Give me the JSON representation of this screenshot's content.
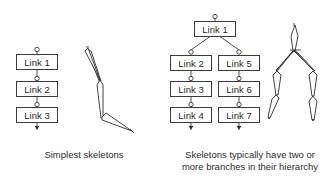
{
  "left_diagram": {
    "caption": "Simplest skeletons",
    "links": [
      {
        "label": "Link 1"
      },
      {
        "label": "Link 2"
      },
      {
        "label": "Link 3"
      }
    ]
  },
  "right_diagram": {
    "caption_line1": "Skeletons typically have two or",
    "caption_line2": "more branches in their hierarchy",
    "root": {
      "label": "Link 1"
    },
    "branch_left": [
      {
        "label": "Link 2"
      },
      {
        "label": "Link 3"
      },
      {
        "label": "Link 4"
      }
    ],
    "branch_right": [
      {
        "label": "Link 5"
      },
      {
        "label": "Link 6"
      },
      {
        "label": "Link 7"
      }
    ]
  },
  "colors": {
    "stroke": "#3a3a3a",
    "background": "#ffffff",
    "text": "#2a2a2a"
  }
}
